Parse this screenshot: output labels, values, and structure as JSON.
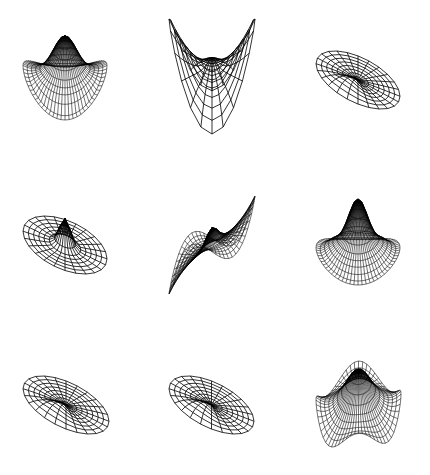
{
  "figure": {
    "background": "#ffffff",
    "stroke_color": "#000000",
    "layout": {
      "rows": 3,
      "cols": 3
    },
    "panels": [
      {
        "id": "p11",
        "row": 0,
        "col": 0,
        "box": [
          22,
          35,
          86,
          86
        ],
        "density": "dense",
        "nr": 10,
        "nt": 64,
        "mode": "peak-lobes",
        "n": 2,
        "m": 0,
        "amp": 0.85,
        "tilt": 0.55
      },
      {
        "id": "p12",
        "row": 0,
        "col": 1,
        "box": [
          168,
          18,
          88,
          117
        ],
        "density": "coarse",
        "nr": 8,
        "nt": 24,
        "mode": "saddle",
        "n": 2,
        "m": 2,
        "amp": 1.2,
        "tilt": 0.5
      },
      {
        "id": "p13",
        "row": 0,
        "col": 2,
        "box": [
          315,
          50,
          86,
          60
        ],
        "density": "coarse",
        "nr": 8,
        "nt": 24,
        "mode": "tilt",
        "n": 1,
        "m": 1,
        "amp": 0.25,
        "tilt": 0.42
      },
      {
        "id": "p21",
        "row": 1,
        "col": 0,
        "box": [
          22,
          215,
          86,
          60
        ],
        "density": "coarse",
        "nr": 8,
        "nt": 24,
        "mode": "tilt-peak",
        "n": 1,
        "m": 1,
        "amp": 0.25,
        "tilt": 0.42
      },
      {
        "id": "p22",
        "row": 1,
        "col": 1,
        "box": [
          168,
          195,
          88,
          100
        ],
        "density": "dense-radial",
        "nr": 10,
        "nt": 64,
        "mode": "spiral",
        "n": 3,
        "m": 1,
        "amp": 0.8,
        "tilt": 0.5
      },
      {
        "id": "p23",
        "row": 1,
        "col": 2,
        "box": [
          315,
          198,
          86,
          88
        ],
        "density": "dense",
        "nr": 10,
        "nt": 64,
        "mode": "peak-dip",
        "n": 4,
        "m": 0,
        "amp": 0.7,
        "tilt": 0.45
      },
      {
        "id": "p31",
        "row": 2,
        "col": 0,
        "box": [
          22,
          375,
          88,
          60
        ],
        "density": "coarse",
        "nr": 8,
        "nt": 24,
        "mode": "tilt",
        "n": 1,
        "m": 1,
        "amp": 0.25,
        "tilt": 0.42
      },
      {
        "id": "p32",
        "row": 2,
        "col": 1,
        "box": [
          168,
          375,
          87,
          60
        ],
        "density": "coarse",
        "nr": 8,
        "nt": 24,
        "mode": "tilt",
        "n": 1,
        "m": 1,
        "amp": 0.25,
        "tilt": 0.42
      },
      {
        "id": "p33",
        "row": 2,
        "col": 2,
        "box": [
          315,
          360,
          87,
          88
        ],
        "density": "dense",
        "nr": 10,
        "nt": 64,
        "mode": "diamond",
        "n": 2,
        "m": 4,
        "amp": 0.8,
        "tilt": 0.55
      }
    ]
  }
}
